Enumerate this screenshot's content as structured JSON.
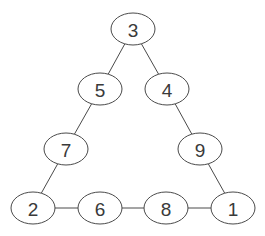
{
  "diagram": {
    "type": "number-triangle",
    "nodes": [
      {
        "id": "n3",
        "label": "3",
        "x": 133,
        "y": 29
      },
      {
        "id": "n5",
        "label": "5",
        "x": 100,
        "y": 89
      },
      {
        "id": "n4",
        "label": "4",
        "x": 167,
        "y": 89
      },
      {
        "id": "n7",
        "label": "7",
        "x": 66,
        "y": 149
      },
      {
        "id": "n9",
        "label": "9",
        "x": 200,
        "y": 149
      },
      {
        "id": "n2",
        "label": "2",
        "x": 33,
        "y": 208
      },
      {
        "id": "n6",
        "label": "6",
        "x": 100,
        "y": 208
      },
      {
        "id": "n8",
        "label": "8",
        "x": 166,
        "y": 208
      },
      {
        "id": "n1",
        "label": "1",
        "x": 233,
        "y": 208
      }
    ],
    "edges": [
      [
        "n3",
        "n5"
      ],
      [
        "n3",
        "n4"
      ],
      [
        "n5",
        "n7"
      ],
      [
        "n4",
        "n9"
      ],
      [
        "n7",
        "n2"
      ],
      [
        "n9",
        "n1"
      ],
      [
        "n2",
        "n6"
      ],
      [
        "n6",
        "n8"
      ],
      [
        "n8",
        "n1"
      ]
    ],
    "sides": {
      "left": [
        "3",
        "5",
        "7",
        "2"
      ],
      "right": [
        "3",
        "4",
        "9",
        "1"
      ],
      "bottom": [
        "2",
        "6",
        "8",
        "1"
      ]
    }
  }
}
